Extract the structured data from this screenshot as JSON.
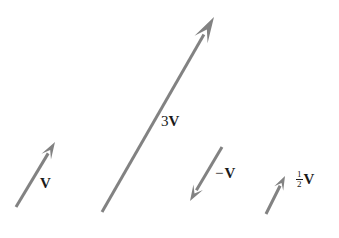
{
  "figure": {
    "name": "vector-scalar-multiplication-diagram",
    "background_color": "#ffffff",
    "width": 339,
    "height": 238,
    "stroke_color": "#808080",
    "label_color": "#1a1a1a"
  },
  "labels": {
    "v": {
      "coefficient": "",
      "symbol": "V"
    },
    "three_v": {
      "coefficient": "3",
      "symbol": "V"
    },
    "negative_v": {
      "coefficient": "−",
      "symbol": "V"
    },
    "half_v": {
      "numerator": "1",
      "denominator": "2",
      "symbol": "V"
    }
  },
  "chart_data": {
    "type": "diagram",
    "title": "",
    "xlabel": "",
    "ylabel": "",
    "grid": false,
    "legend": "none",
    "xlim": [
      0,
      339
    ],
    "ylim": [
      0,
      238
    ],
    "vectors": [
      {
        "name": "V",
        "label": "V",
        "scalar": 1,
        "tail": [
          16,
          207
        ],
        "tip": [
          55,
          142
        ],
        "dx": 39,
        "dy": -65,
        "color": "#828282",
        "stroke_width": 3.0,
        "head_length": 17,
        "head_half_width": 5.5,
        "label_position": [
          40,
          176
        ]
      },
      {
        "name": "3V",
        "label": "3V",
        "scalar": 3,
        "tail": [
          102,
          212
        ],
        "tip": [
          214,
          17
        ],
        "dx": 112,
        "dy": -195,
        "color": "#828282",
        "stroke_width": 3.0,
        "head_length": 26,
        "head_half_width": 7.5,
        "label_position": [
          161,
          114
        ]
      },
      {
        "name": "-V",
        "label": "−V",
        "scalar": -1,
        "tail": [
          222,
          147
        ],
        "tip": [
          190,
          201
        ],
        "dx": -32,
        "dy": 54,
        "color": "#828282",
        "stroke_width": 3.0,
        "head_length": 16,
        "head_half_width": 5.5,
        "label_position": [
          215,
          166
        ]
      },
      {
        "name": "0.5V",
        "label": "1/2 V",
        "scalar": 0.5,
        "tail": [
          266,
          214
        ],
        "tip": [
          285,
          176
        ],
        "dx": 19,
        "dy": -38,
        "color": "#828282",
        "stroke_width": 3.0,
        "head_length": 14,
        "head_half_width": 5.0,
        "label_position": [
          296,
          171
        ]
      }
    ]
  }
}
